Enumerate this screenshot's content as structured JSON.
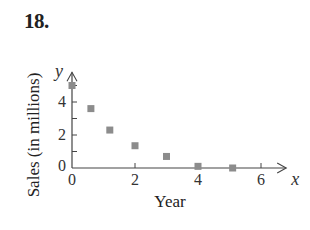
{
  "problem": {
    "number": "18."
  },
  "chart_data": {
    "type": "scatter",
    "title": "",
    "xlabel": "Year",
    "ylabel": "Sales (in millions)",
    "x_axis_var": "x",
    "y_axis_var": "y",
    "xlim": [
      0,
      6.8
    ],
    "ylim": [
      0,
      5.8
    ],
    "x_ticks": [
      0,
      2,
      4,
      6
    ],
    "x_tick_labels": [
      "0",
      "2",
      "4",
      "6"
    ],
    "y_ticks": [
      0,
      1,
      2,
      3,
      4,
      5
    ],
    "y_tick_labels": [
      "0",
      "",
      "2",
      "",
      "4",
      ""
    ],
    "grid": false,
    "legend": null,
    "marker": "square",
    "marker_color": "#8c8c8c",
    "axis_color": "#444444",
    "series": [
      {
        "name": "Sales",
        "points": [
          {
            "x": 0,
            "y": 5.0
          },
          {
            "x": 0.6,
            "y": 3.6
          },
          {
            "x": 1.2,
            "y": 2.3
          },
          {
            "x": 2.0,
            "y": 1.35
          },
          {
            "x": 3.0,
            "y": 0.7
          },
          {
            "x": 4.0,
            "y": 0.1
          },
          {
            "x": 5.1,
            "y": 0.0
          }
        ]
      }
    ]
  }
}
